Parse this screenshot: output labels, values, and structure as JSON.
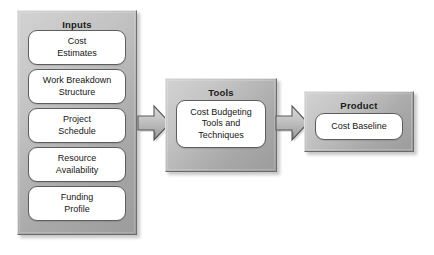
{
  "diagram": {
    "colors": {
      "panel_light": "#d2d2d2",
      "panel_dark": "#9c9c9c",
      "item_fill": "#ffffff",
      "item_border": "#5d5d5d",
      "arrow_fill": "#b5b5b5",
      "arrow_border": "#555555",
      "text": "#161616",
      "background": "#ffffff"
    },
    "groups": [
      {
        "id": "inputs",
        "title": "Inputs",
        "items": [
          {
            "id": "cost-estimates",
            "line1": "Cost",
            "line2": "Estimates"
          },
          {
            "id": "work-breakdown",
            "line1": "Work Breakdown",
            "line2": "Structure"
          },
          {
            "id": "project-schedule",
            "line1": "Project",
            "line2": "Schedule"
          },
          {
            "id": "resource-availability",
            "line1": "Resource",
            "line2": "Availability"
          },
          {
            "id": "funding-profile",
            "line1": "Funding",
            "line2": "Profile"
          }
        ]
      },
      {
        "id": "tools",
        "title": "Tools",
        "items": [
          {
            "id": "cost-budgeting-tools",
            "line1": "Cost Budgeting",
            "line2": "Tools and",
            "line3": "Techniques"
          }
        ]
      },
      {
        "id": "product",
        "title": "Product",
        "items": [
          {
            "id": "cost-baseline",
            "line1": "Cost Baseline",
            "line2": "",
            "line3": ""
          }
        ]
      }
    ],
    "arrows": [
      {
        "id": "inputs-to-tools",
        "from": "inputs",
        "to": "tools",
        "direction": "right"
      },
      {
        "id": "tools-to-product",
        "from": "tools",
        "to": "product",
        "direction": "right"
      }
    ]
  }
}
